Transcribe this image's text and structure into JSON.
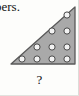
{
  "page": {
    "width": 79,
    "height": 96,
    "background": "#fdfdfb"
  },
  "text_fragment": {
    "value": "bers.",
    "description": "clipped serif word ending, top-left of crop"
  },
  "caption": {
    "value": "?",
    "description": "question mark label beneath the triangular dot figure"
  },
  "figure": {
    "name": "triangular-dot-array",
    "shape": "right-triangle",
    "right_angle_corner": "bottom-right",
    "fill_color": "#a9a9a9",
    "stroke_color": "#595959",
    "dot_fill": "#f2f2f2",
    "dot_stroke": "#4a4a4a",
    "rows": 4,
    "dots_per_row": [
      1,
      2,
      3,
      4
    ],
    "total_dots": 10,
    "geometry": {
      "apex_top_right": [
        68,
        3
      ],
      "corner_bottom_right": [
        68,
        60
      ],
      "corner_bottom_left": [
        4,
        60
      ]
    },
    "dots": [
      {
        "row": 1,
        "col": 1,
        "cx": 60,
        "cy": 11
      },
      {
        "row": 2,
        "col": 1,
        "cx": 45,
        "cy": 27
      },
      {
        "row": 2,
        "col": 2,
        "cx": 60,
        "cy": 27
      },
      {
        "row": 3,
        "col": 1,
        "cx": 30,
        "cy": 43
      },
      {
        "row": 3,
        "col": 2,
        "cx": 45,
        "cy": 43
      },
      {
        "row": 3,
        "col": 3,
        "cx": 60,
        "cy": 43
      },
      {
        "row": 4,
        "col": 1,
        "cx": 15,
        "cy": 55
      },
      {
        "row": 4,
        "col": 2,
        "cx": 30,
        "cy": 55
      },
      {
        "row": 4,
        "col": 3,
        "cx": 45,
        "cy": 55
      },
      {
        "row": 4,
        "col": 4,
        "cx": 60,
        "cy": 55
      }
    ]
  }
}
